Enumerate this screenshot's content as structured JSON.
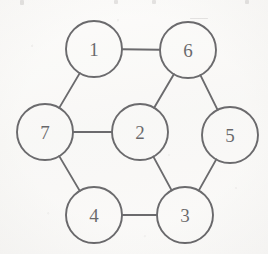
{
  "figure": {
    "kind": "undirected-graph-diagram",
    "background_color": "#f7f6f4",
    "ink_color": "#1c1b1f",
    "node_radius": 28,
    "nodes": [
      {
        "id": "1",
        "label": "1",
        "cx": 94,
        "cy": 49
      },
      {
        "id": "6",
        "label": "6",
        "cx": 188,
        "cy": 50
      },
      {
        "id": "7",
        "label": "7",
        "cx": 45,
        "cy": 132
      },
      {
        "id": "2",
        "label": "2",
        "cx": 140,
        "cy": 132
      },
      {
        "id": "5",
        "label": "5",
        "cx": 230,
        "cy": 135
      },
      {
        "id": "4",
        "label": "4",
        "cx": 94,
        "cy": 215
      },
      {
        "id": "3",
        "label": "3",
        "cx": 185,
        "cy": 215
      }
    ],
    "edges": [
      {
        "from": "1",
        "to": "6"
      },
      {
        "from": "1",
        "to": "7"
      },
      {
        "from": "6",
        "to": "2"
      },
      {
        "from": "6",
        "to": "5"
      },
      {
        "from": "7",
        "to": "2"
      },
      {
        "from": "7",
        "to": "4"
      },
      {
        "from": "2",
        "to": "3"
      },
      {
        "from": "5",
        "to": "3"
      },
      {
        "from": "4",
        "to": "3"
      }
    ],
    "top_artifacts": [
      {
        "x": 20,
        "y": 0,
        "w": 4,
        "h": 5
      },
      {
        "x": 114,
        "y": 0,
        "w": 4,
        "h": 4
      },
      {
        "x": 152,
        "y": 0,
        "w": 4,
        "h": 4
      },
      {
        "x": 245,
        "y": 0,
        "w": 4,
        "h": 4
      },
      {
        "x": 190,
        "y": 18,
        "w": 18,
        "h": 1
      }
    ]
  }
}
